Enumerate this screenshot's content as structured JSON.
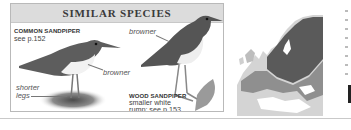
{
  "panel": {
    "title": "SIMILAR SPECIES",
    "species": [
      {
        "name": "COMMON SANDPIPER",
        "reference": "see p.152",
        "annotations": [
          "browner",
          "shorter",
          "legs"
        ]
      },
      {
        "name": "WOOD SANDPIPER",
        "description_line1": "smaller white",
        "description_line2": "rump; see p.153",
        "annotations": [
          "browner"
        ]
      }
    ]
  },
  "map": {
    "subject": "range-map-europe",
    "colors": {
      "breeding": "#5a5a5a",
      "resident": "#8f8f8f",
      "land": "#d4d4d4",
      "sea": "#ffffff"
    }
  }
}
